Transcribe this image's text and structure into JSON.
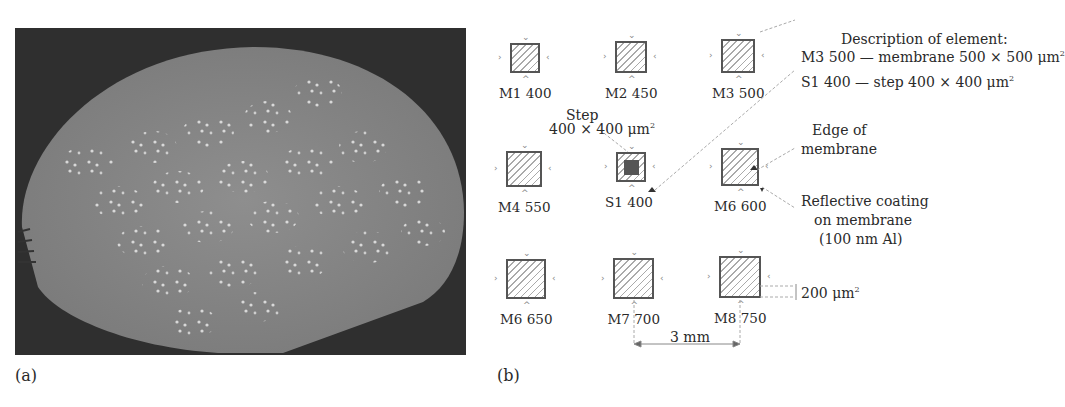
{
  "panel_a": {
    "label": "(a)",
    "description": "Photograph of silicon wafer with arrays of membrane elements"
  },
  "panel_b": {
    "label": "(b)",
    "elements": [
      {
        "id": "M1 400",
        "x": 510,
        "y": 43,
        "size": 30,
        "step": false
      },
      {
        "id": "M2 450",
        "x": 615,
        "y": 41,
        "size": 32,
        "step": false
      },
      {
        "id": "M3 500",
        "x": 721,
        "y": 39,
        "size": 34,
        "step": false
      },
      {
        "id": "M4 550",
        "x": 506,
        "y": 151,
        "size": 36,
        "step": false
      },
      {
        "id": "S1 400",
        "x": 616,
        "y": 152,
        "size": 30,
        "step": true
      },
      {
        "id": "M6 600",
        "x": 721,
        "y": 148,
        "size": 38,
        "step": false
      },
      {
        "id": "M6 650",
        "x": 506,
        "y": 259,
        "size": 40,
        "step": false
      },
      {
        "id": "M7 700",
        "x": 613,
        "y": 258,
        "size": 41,
        "step": false
      },
      {
        "id": "M8 750",
        "x": 719,
        "y": 256,
        "size": 42,
        "step": false
      }
    ],
    "annotations": {
      "step_title": "Step",
      "step_size": "400 × 400 μm",
      "description_title": "Description of element:",
      "description_m3": "M3 500 — membrane 500 × 500 μm",
      "description_s1": "S1  400 — step 400 × 400 μm",
      "edge_line1": "Edge of",
      "edge_line2": "membrane",
      "coating_line1": "Reflective coating",
      "coating_line2": "on membrane",
      "coating_line3": "(100 nm Al)",
      "dim_200": "200 μm",
      "dim_3mm": "3 mm",
      "sup2": "2"
    }
  }
}
